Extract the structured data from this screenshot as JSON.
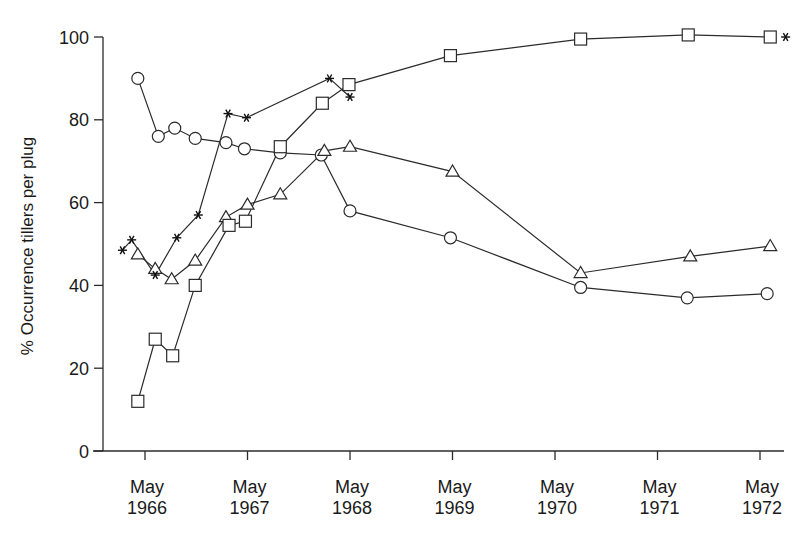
{
  "chart_data": {
    "type": "line",
    "title": "",
    "xlabel": "",
    "ylabel": "% Occurrence tillers per plug",
    "ylim": [
      0,
      100
    ],
    "yticks": [
      0,
      20,
      40,
      60,
      80,
      100
    ],
    "xticks": [
      {
        "label_line1": "May",
        "label_line2": "1966",
        "x": 1966.0
      },
      {
        "label_line1": "May",
        "label_line2": "1967",
        "x": 1967.0
      },
      {
        "label_line1": "May",
        "label_line2": "1968",
        "x": 1968.0
      },
      {
        "label_line1": "May",
        "label_line2": "1969",
        "x": 1969.0
      },
      {
        "label_line1": "May",
        "label_line2": "1970",
        "x": 1970.0
      },
      {
        "label_line1": "May",
        "label_line2": "1971",
        "x": 1971.0
      },
      {
        "label_line1": "May",
        "label_line2": "1972",
        "x": 1972.0
      }
    ],
    "xlim": [
      1965.6,
      1972.35
    ],
    "grid": false,
    "legend": "none",
    "series": [
      {
        "name": "circles",
        "marker": "circle",
        "points": [
          [
            1965.93,
            90
          ],
          [
            1966.13,
            76
          ],
          [
            1966.29,
            78
          ],
          [
            1966.49,
            75.5
          ],
          [
            1966.79,
            74.5
          ],
          [
            1966.97,
            73
          ],
          [
            1967.32,
            72
          ],
          [
            1967.72,
            71.5
          ],
          [
            1968.0,
            58
          ],
          [
            1968.98,
            51.5
          ],
          [
            1970.25,
            39.5
          ],
          [
            1971.29,
            37
          ],
          [
            1972.07,
            38
          ]
        ]
      },
      {
        "name": "triangles",
        "marker": "triangle",
        "points": [
          [
            1965.93,
            47.5
          ],
          [
            1966.1,
            44
          ],
          [
            1966.26,
            41.5
          ],
          [
            1966.49,
            46
          ],
          [
            1966.79,
            56.5
          ],
          [
            1967.0,
            59.5
          ],
          [
            1967.32,
            62
          ],
          [
            1967.75,
            72.5
          ],
          [
            1968.0,
            73.5
          ],
          [
            1969.0,
            67.5
          ],
          [
            1970.25,
            43
          ],
          [
            1971.32,
            47
          ],
          [
            1972.1,
            49.5
          ]
        ]
      },
      {
        "name": "squares",
        "marker": "square",
        "points": [
          [
            1965.93,
            12
          ],
          [
            1966.1,
            27
          ],
          [
            1966.27,
            23
          ],
          [
            1966.49,
            40
          ],
          [
            1966.82,
            54.5
          ],
          [
            1966.98,
            55.5
          ],
          [
            1967.32,
            73.5
          ],
          [
            1967.73,
            84
          ],
          [
            1967.99,
            88.5
          ],
          [
            1968.98,
            95.5
          ],
          [
            1970.25,
            99.5
          ],
          [
            1971.3,
            100.5
          ],
          [
            1972.1,
            100
          ]
        ]
      },
      {
        "name": "asterisks",
        "marker": "asterisk",
        "points": [
          [
            1965.78,
            48.5
          ],
          [
            1965.87,
            51
          ],
          [
            1966.1,
            42.5
          ],
          [
            1966.31,
            51.5
          ],
          [
            1966.52,
            57
          ],
          [
            1966.81,
            81.5
          ],
          [
            1966.99,
            80.5
          ],
          [
            1967.8,
            90
          ],
          [
            1968.0,
            85.5
          ],
          [
            1972.25,
            100
          ]
        ]
      }
    ]
  }
}
